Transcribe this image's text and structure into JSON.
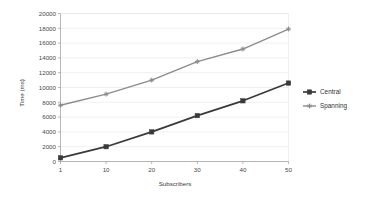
{
  "chart_data": {
    "type": "line",
    "title": "",
    "xlabel": "Subscribers",
    "ylabel": "Time (ms)",
    "x": [
      1,
      10,
      20,
      30,
      40,
      50
    ],
    "xtick_labels": [
      "1",
      "10",
      "20",
      "30",
      "40",
      "50"
    ],
    "ytick_labels": [
      "0",
      "2000",
      "4000",
      "6000",
      "8000",
      "10000",
      "12000",
      "14000",
      "16000",
      "18000",
      "20000"
    ],
    "ytick_values": [
      0,
      2000,
      4000,
      6000,
      8000,
      10000,
      12000,
      14000,
      16000,
      18000,
      20000
    ],
    "ylim": [
      0,
      20000
    ],
    "grid": true,
    "legend_position": "right",
    "series": [
      {
        "name": "Central",
        "values": [
          500,
          2000,
          4000,
          6200,
          8200,
          10600
        ],
        "color": "#3a3a3a",
        "marker": "square"
      },
      {
        "name": "Spanning",
        "values": [
          7600,
          9100,
          11000,
          13500,
          15200,
          17900
        ],
        "color": "#8c8c8c",
        "marker": "cross"
      }
    ]
  },
  "legend": {
    "items": [
      {
        "label": "Central",
        "marker_name": "legend-marker-square"
      },
      {
        "label": "Spanning",
        "marker_name": "legend-marker-cross"
      }
    ]
  },
  "colors": {
    "central": "#3a3a3a",
    "spanning": "#8c8c8c",
    "grid": "#e3e3e3",
    "axis": "#9a9a9a",
    "background": "#ffffff"
  }
}
